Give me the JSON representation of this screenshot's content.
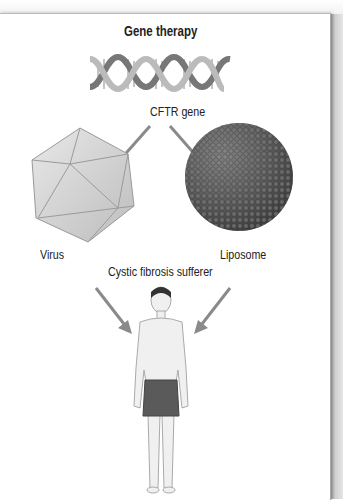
{
  "title": "Gene therapy",
  "labels": {
    "gene": "CFTR gene",
    "virus": "Virus",
    "liposome": "Liposome",
    "patient": "Cystic fibrosis sufferer"
  },
  "colors": {
    "arrow": "#8a8a8a",
    "virus_fill": "#d8d8d8",
    "liposome_fill": "#555555",
    "shorts": "#5a5a5a",
    "skin": "#f0f0f0"
  }
}
